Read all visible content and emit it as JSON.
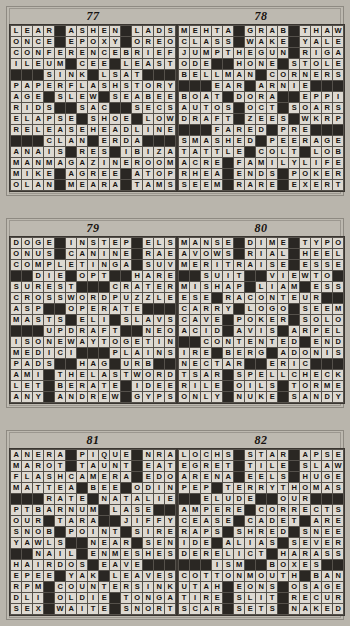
{
  "page": {
    "background_color": "#b9b5ac",
    "cell_fill_color": "#ddd9d1",
    "block_color": "#2a2723",
    "text_color": "#15120f"
  },
  "bands": [
    {
      "puzzles": [
        "77",
        "78"
      ]
    },
    {
      "puzzles": [
        "79",
        "80"
      ]
    },
    {
      "puzzles": [
        "81",
        "82"
      ]
    }
  ],
  "puzzles": [
    {
      "number": "77",
      "columns": 15,
      "rows": 15,
      "grid": [
        "LEAR#ASHEN#LADS",
        "ONCE#EPOXY#OREO",
        "CONFERENCEBRIEF",
        "ILEUM#CEE#LEAST",
        "###SINK#LSAT###",
        "PAPERFLASHSTORY",
        "AGE#SLEW#SEABEE",
        "RIDS##SAC##SECS",
        "ELAPSE#SHOE#LOW",
        "RELEASEHEADLINE",
        "###CLAN#ERDA###",
        "ANAIS#RES#IBIZA",
        "MANMAGAZINEROOM",
        "MIKE#AGREE#ATOP",
        "OLAN#MEARA#TAMS"
      ]
    },
    {
      "number": "78",
      "columns": 15,
      "rows": 15,
      "grid": [
        "MEHTA#GRAB#THAW",
        "CLASS#WAKE#YALE",
        "JUMPTHEGUN#RIGA",
        "ODE##HONE#STOLEN",
        "BELLMAN#CORNERS",
        "###EAR#ARNIE###",
        "BOAT#DORA##EPPIE",
        "AUTOS#OCT#SOARS",
        "DRAFT#ZEES#WKRP",
        "###FARED#PRE###",
        "SMASHED#PEERAGE",
        "TATTLE#COLT#LOB",
        "ACRE#FAMILYLIFE",
        "RHEA#ENDS#POKER",
        "SEEM#RARE#EXERT"
      ]
    },
    {
      "number": "79",
      "columns": 15,
      "rows": 15,
      "grid": [
        "DOGE#INSTEP#ELS",
        "ONUS#CANINE#RAE",
        "COMPLETINGA#SUV",
        "##DIE#OPT##HARE",
        "SUREST###CRATER",
        "CROSSWORDPUZZLE",
        "ASP##OPERATE###",
        "MASTS#ELI#SLAVS",
        "###UPDRAFT##NEO",
        "ISONEWAYTOGETIN",
        "MEDICI###PLAINS",
        "PADS##HAG#URB##",
        "AMI#THELASTWORD",
        "LET#BERATE#IDEE",
        "ANY#ANDREW#GYPS"
      ]
    },
    {
      "number": "80",
      "columns": 15,
      "rows": 15,
      "grid": [
        "MANSE#DIME#TYPO",
        "AVOWS#RIAL#HEEL",
        "MERITRAISE#ESSE",
        "##SUIT##VIEWTO",
        "MISHAP#LIAM#ESS",
        "ESE#RACONTEUR##",
        "CARRY#LOGO#SEEM",
        "CAVE#POKER#SOLO",
        "ACID#AVIS#ARPEL",
        "##CONTENTED#END",
        "IRE#BERG#ADONIS",
        "NECTAR##ERIC###",
        "TSAR#SPELLCHECK",
        "RILE#OILS#TORME",
        "ONLY#NUKE#SANDY"
      ]
    },
    {
      "number": "81",
      "columns": 15,
      "rows": 15,
      "grid": [
        "ANERA#PIQUE#NRA",
        "MAROT#TAUNT#EAT",
        "FLASHCAMERA#EDO",
        "MATTEA#BEE#ODIN",
        "###RATE#NATALIE",
        "PTBARNUM#LASE##",
        "OUR#TARA##JIFFY",
        "SNOB#POINT#SIRE",
        "YAWLS##NEAR#SEN",
        "##NAIL#ENMESHES",
        "HAIRDOS#EAVE###",
        "EPEE#YAK#LEAVES",
        "RPM#COUNTERSINK",
        "DLI#OLDIE#TONGA",
        "SEX#WAITE#SNORT"
      ]
    },
    {
      "number": "82",
      "columns": 15,
      "rows": 15,
      "grid": [
        "LOCHS#STAR#APSE",
        "EGRET#TILE#SLAW",
        "ARENA#EELS#HUGE",
        "PEP#TERRYTHOMAS",
        "##ELUDE##OUR###",
        "AMPERE#CORRECTS",
        "CEASE#CADET#ARE",
        "RAPS#SHRED#SNEE",
        "IDE#ALIAS#SEVER",
        "DERELICT#HARASS",
        "###ISM##BOXES##",
        "COTTONMOUTH#BAN",
        "UTAH#EONS#OSAGE",
        "TIRE#SLIT#RECUR",
        "SCAR#SETS#NAKED"
      ]
    }
  ]
}
